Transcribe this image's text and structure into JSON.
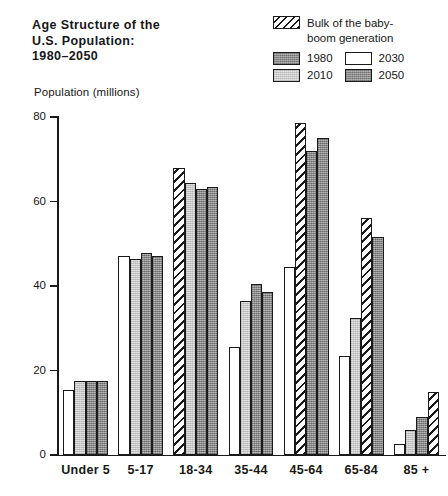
{
  "title": {
    "line1": "Age Structure of the",
    "line2": "U.S. Population:",
    "line3": "1980–2050"
  },
  "axis_title": "Population (millions)",
  "legend": {
    "boom_label_line1": "Bulk of the baby-",
    "boom_label_line2": "boom generation",
    "boom_swatch": "hatched-swatch",
    "items": [
      {
        "label": "1980",
        "swatch": "dark-gray-swatch"
      },
      {
        "label": "2030",
        "swatch": "white-swatch"
      },
      {
        "label": "2010",
        "swatch": "light-gray-swatch"
      },
      {
        "label": "2050",
        "swatch": "dark-gray-swatch"
      }
    ]
  },
  "yticks": [
    "0",
    "20",
    "40",
    "60",
    "80"
  ],
  "chart_data": {
    "type": "bar",
    "title": "Age Structure of the U.S. Population: 1980–2050",
    "xlabel": "",
    "ylabel": "Population (millions)",
    "ylim": [
      0,
      80
    ],
    "yticks": [
      0,
      20,
      40,
      60,
      80
    ],
    "grid": false,
    "legend_position": "top-right",
    "categories": [
      "Under 5",
      "5-17",
      "18-34",
      "35-44",
      "45-64",
      "65-84",
      "85 +"
    ],
    "series": [
      {
        "name": "1980",
        "values": [
          15.5,
          47.2,
          68.0,
          25.5,
          44.5,
          23.5,
          2.5
        ],
        "baby_boom_flags": [
          false,
          false,
          true,
          false,
          false,
          false,
          false
        ]
      },
      {
        "name": "2010",
        "values": [
          17.6,
          46.5,
          64.5,
          36.5,
          78.5,
          32.5,
          6.0
        ],
        "baby_boom_flags": [
          false,
          false,
          false,
          false,
          true,
          false,
          false
        ]
      },
      {
        "name": "2030",
        "values": [
          17.5,
          47.8,
          63.0,
          40.5,
          72.0,
          56.0,
          9.0
        ],
        "baby_boom_flags": [
          false,
          false,
          false,
          false,
          false,
          true,
          false
        ]
      },
      {
        "name": "2050",
        "values": [
          17.6,
          47.0,
          63.5,
          38.5,
          75.0,
          51.5,
          15.0
        ],
        "baby_boom_flags": [
          false,
          false,
          false,
          false,
          false,
          false,
          true
        ]
      }
    ],
    "annotations": [
      "Hatched bars mark the bulk of the baby-boom generation"
    ]
  }
}
